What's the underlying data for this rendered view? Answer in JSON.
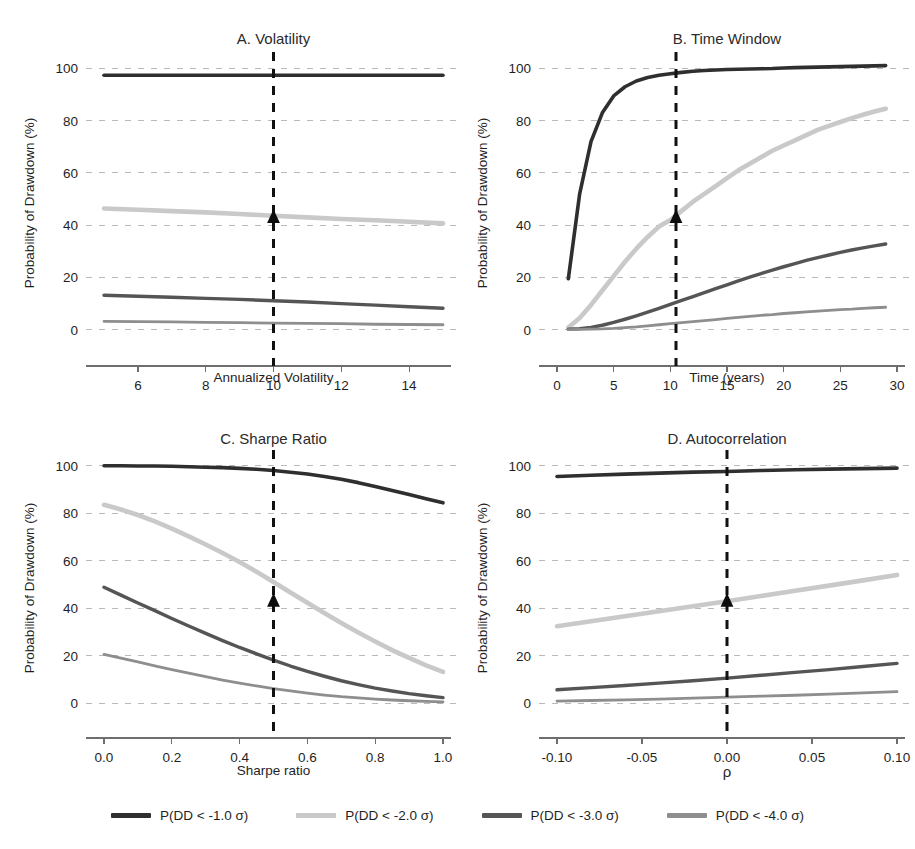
{
  "figure": {
    "width": 915,
    "height": 849,
    "background": "#ffffff"
  },
  "series_styles": [
    {
      "name": "P(DD < -1.0 σ)",
      "color": "#2f2f2f",
      "width": 3.6
    },
    {
      "name": "P(DD < -2.0 σ)",
      "color": "#c9c9c9",
      "width": 4.6
    },
    {
      "name": "P(DD < -3.0 σ)",
      "color": "#555555",
      "width": 3.4
    },
    {
      "name": "P(DD < -4.0 σ)",
      "color": "#8e8e8e",
      "width": 2.8
    }
  ],
  "legend": {
    "position": "bottom-center",
    "items": [
      {
        "label": "P(DD < -1.0 σ)",
        "color": "#2f2f2f"
      },
      {
        "label": "P(DD < -2.0 σ)",
        "color": "#c9c9c9"
      },
      {
        "label": "P(DD < -3.0 σ)",
        "color": "#555555"
      },
      {
        "label": "P(DD < -4.0 σ)",
        "color": "#8e8e8e"
      }
    ]
  },
  "shared": {
    "ylabel": "Probability of Drawdown (%)",
    "yticks": [
      0,
      20,
      40,
      60,
      80,
      100
    ],
    "ylim": [
      -7,
      104
    ],
    "grid": true,
    "marker_symbol": "triangle-up",
    "marker_color": "#0d0d0d",
    "vline_color": "#111111"
  },
  "chart_data": [
    {
      "type": "line",
      "panel": "A",
      "title": "A. Volatility",
      "xlabel": "Annualized Volatility",
      "ylabel": "Probability of Drawdown (%)",
      "xticks": [
        6,
        8,
        10,
        12,
        14
      ],
      "xlim": [
        5,
        15
      ],
      "yticks": [
        0,
        20,
        40,
        60,
        80,
        100
      ],
      "ylim": [
        -7,
        104
      ],
      "grid": true,
      "vline_x": 10,
      "marker": {
        "x": 10,
        "y": 43.0
      },
      "x": [
        5,
        6,
        7,
        8,
        9,
        10,
        11,
        12,
        13,
        14,
        15
      ],
      "series": [
        {
          "name": "P(DD < -1.0 σ)",
          "values": [
            97.4,
            97.4,
            97.4,
            97.4,
            97.4,
            97.4,
            97.4,
            97.4,
            97.4,
            97.4,
            97.4
          ]
        },
        {
          "name": "P(DD < -2.0 σ)",
          "values": [
            46.4,
            45.9,
            45.4,
            44.9,
            44.3,
            43.6,
            43.0,
            42.4,
            41.9,
            41.3,
            40.7
          ]
        },
        {
          "name": "P(DD < -3.0 σ)",
          "values": [
            13.2,
            12.8,
            12.4,
            12.0,
            11.6,
            11.1,
            10.6,
            10.0,
            9.4,
            8.8,
            8.2
          ]
        },
        {
          "name": "P(DD < -4.0 σ)",
          "values": [
            3.2,
            3.1,
            3.0,
            2.8,
            2.7,
            2.5,
            2.4,
            2.3,
            2.1,
            2.0,
            1.9
          ]
        }
      ]
    },
    {
      "type": "line",
      "panel": "B",
      "title": "B. Time Window",
      "xlabel": "Time (years)",
      "ylabel": "Probability of Drawdown (%)",
      "xticks": [
        0,
        5,
        10,
        15,
        20,
        25,
        30
      ],
      "xlim": [
        0,
        30
      ],
      "yticks": [
        0,
        20,
        40,
        60,
        80,
        100
      ],
      "ylim": [
        -7,
        104
      ],
      "grid": true,
      "vline_x": 10.5,
      "marker": {
        "x": 10.5,
        "y": 43.0
      },
      "x": [
        1,
        2,
        3,
        4,
        5,
        6,
        7,
        8,
        9,
        10,
        11,
        12,
        13,
        14,
        15,
        16,
        17,
        18,
        19,
        20,
        21,
        22,
        23,
        24,
        25,
        26,
        27,
        28,
        29
      ],
      "series": [
        {
          "name": "P(DD < -1.0 σ)",
          "values": [
            19.5,
            52.0,
            72.0,
            83.0,
            89.5,
            93.0,
            95.2,
            96.5,
            97.4,
            98.0,
            98.5,
            98.9,
            99.2,
            99.4,
            99.6,
            99.7,
            99.8,
            99.9,
            100.0,
            100.2,
            100.3,
            100.4,
            100.5,
            100.6,
            100.7,
            100.8,
            100.9,
            101.0,
            101.1
          ]
        },
        {
          "name": "P(DD < -2.0 σ)",
          "values": [
            0.8,
            4.5,
            9.5,
            15.0,
            20.5,
            26.0,
            31.0,
            35.5,
            39.5,
            42.0,
            45.5,
            49.0,
            52.0,
            55.0,
            58.0,
            61.0,
            63.5,
            66.0,
            68.5,
            70.5,
            72.5,
            74.5,
            76.5,
            78.0,
            79.5,
            81.0,
            82.3,
            83.5,
            84.6
          ]
        },
        {
          "name": "P(DD < -3.0 σ)",
          "values": [
            0.2,
            0.4,
            0.9,
            1.7,
            2.8,
            4.0,
            5.3,
            6.7,
            8.2,
            9.7,
            11.2,
            12.7,
            14.2,
            15.7,
            17.2,
            18.7,
            20.1,
            21.5,
            22.8,
            24.1,
            25.3,
            26.5,
            27.6,
            28.6,
            29.6,
            30.5,
            31.3,
            32.1,
            32.8
          ]
        },
        {
          "name": "P(DD < -4.0 σ)",
          "values": [
            0.05,
            0.1,
            0.2,
            0.3,
            0.5,
            0.8,
            1.1,
            1.5,
            1.9,
            2.3,
            2.7,
            3.1,
            3.5,
            3.9,
            4.3,
            4.7,
            5.1,
            5.5,
            5.8,
            6.2,
            6.5,
            6.8,
            7.1,
            7.4,
            7.7,
            7.9,
            8.2,
            8.4,
            8.6
          ]
        }
      ]
    },
    {
      "type": "line",
      "panel": "C",
      "title": "C. Sharpe Ratio",
      "xlabel": "Sharpe ratio",
      "ylabel": "Probability of Drawdown (%)",
      "xticks": [
        0.0,
        0.2,
        0.4,
        0.6,
        0.8,
        1.0
      ],
      "xtick_labels": [
        "0.0",
        "0.2",
        "0.4",
        "0.6",
        "0.8",
        "1.0"
      ],
      "xlim": [
        0.0,
        1.0
      ],
      "yticks": [
        0,
        20,
        40,
        60,
        80,
        100
      ],
      "ylim": [
        -7,
        104
      ],
      "grid": true,
      "vline_x": 0.5,
      "marker": {
        "x": 0.5,
        "y": 43.0
      },
      "x": [
        0.0,
        0.05,
        0.1,
        0.15,
        0.2,
        0.25,
        0.3,
        0.35,
        0.4,
        0.45,
        0.5,
        0.55,
        0.6,
        0.65,
        0.7,
        0.75,
        0.8,
        0.85,
        0.9,
        0.95,
        1.0
      ],
      "series": [
        {
          "name": "P(DD < -1.0 σ)",
          "values": [
            99.9,
            99.9,
            99.8,
            99.8,
            99.7,
            99.5,
            99.3,
            99.1,
            98.8,
            98.4,
            97.9,
            97.2,
            96.4,
            95.4,
            94.2,
            92.8,
            91.2,
            89.5,
            87.8,
            86.0,
            84.3
          ]
        },
        {
          "name": "P(DD < -2.0 σ)",
          "values": [
            83.5,
            81.5,
            79.2,
            76.5,
            73.5,
            70.2,
            66.8,
            63.2,
            59.4,
            55.3,
            51.0,
            46.6,
            42.3,
            38.0,
            33.8,
            29.8,
            26.0,
            22.4,
            19.1,
            16.0,
            13.2
          ]
        },
        {
          "name": "P(DD < -3.0 σ)",
          "values": [
            48.8,
            45.5,
            42.2,
            39.0,
            35.7,
            32.5,
            29.4,
            26.4,
            23.5,
            20.8,
            18.2,
            15.7,
            13.4,
            11.4,
            9.5,
            7.9,
            6.4,
            5.2,
            4.1,
            3.2,
            2.4
          ]
        },
        {
          "name": "P(DD < -4.0 σ)",
          "values": [
            20.6,
            19.0,
            17.4,
            15.8,
            14.2,
            12.7,
            11.2,
            9.8,
            8.5,
            7.3,
            6.2,
            5.2,
            4.3,
            3.5,
            2.8,
            2.3,
            1.8,
            1.4,
            1.1,
            0.8,
            0.6
          ]
        }
      ]
    },
    {
      "type": "line",
      "panel": "D",
      "title": "D. Autocorrelation",
      "xlabel": "ρ",
      "ylabel": "Probability of Drawdown (%)",
      "xticks": [
        -0.1,
        -0.05,
        0.0,
        0.05,
        0.1
      ],
      "xtick_labels": [
        "-0.10",
        "-0.05",
        "0.00",
        "0.05",
        "0.10"
      ],
      "xlim": [
        -0.1,
        0.1
      ],
      "yticks": [
        0,
        20,
        40,
        60,
        80,
        100
      ],
      "ylim": [
        -7,
        104
      ],
      "grid": true,
      "vline_x": 0.0,
      "marker": {
        "x": 0.0,
        "y": 43.0
      },
      "x": [
        -0.1,
        -0.08,
        -0.06,
        -0.04,
        -0.02,
        0.0,
        0.02,
        0.04,
        0.06,
        0.08,
        0.1
      ],
      "series": [
        {
          "name": "P(DD < -1.0 σ)",
          "values": [
            95.4,
            95.9,
            96.4,
            96.8,
            97.2,
            97.5,
            97.9,
            98.2,
            98.5,
            98.7,
            98.9
          ]
        },
        {
          "name": "P(DD < -2.0 σ)",
          "values": [
            32.4,
            34.5,
            36.6,
            38.7,
            40.8,
            42.9,
            45.1,
            47.3,
            49.5,
            51.7,
            54.0
          ]
        },
        {
          "name": "P(DD < -3.0 σ)",
          "values": [
            5.7,
            6.6,
            7.5,
            8.5,
            9.5,
            10.6,
            11.8,
            13.0,
            14.2,
            15.5,
            16.8
          ]
        },
        {
          "name": "P(DD < -4.0 σ)",
          "values": [
            0.9,
            1.2,
            1.5,
            1.8,
            2.2,
            2.6,
            3.0,
            3.4,
            3.9,
            4.4,
            4.9
          ]
        }
      ]
    }
  ]
}
